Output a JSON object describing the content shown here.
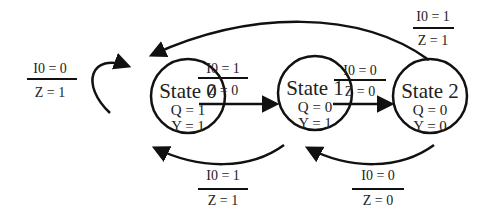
{
  "diagram": {
    "type": "finite-state-machine",
    "colors": {
      "stroke": "#111111",
      "text": "#222222",
      "background": "#ffffff"
    },
    "states": [
      {
        "id": "s0",
        "name": "State 0",
        "q": "Q = 1",
        "y": "Y = 1"
      },
      {
        "id": "s1",
        "name": "State 1",
        "q": "Q = 0",
        "y": "Y = 1"
      },
      {
        "id": "s2",
        "name": "State 2",
        "q": "Q = 0",
        "y": "Y = 0"
      }
    ],
    "transitions": [
      {
        "from": "State 0",
        "to": "State 0",
        "input": "I0 = 0",
        "output": "Z = 1"
      },
      {
        "from": "State 0",
        "to": "State 1",
        "input": "I0 = 1",
        "output": "Z = 0"
      },
      {
        "from": "State 1",
        "to": "State 2",
        "input": "I0 = 0",
        "output": "Z = 0"
      },
      {
        "from": "State 2",
        "to": "State 0",
        "input": "I0 = 1",
        "output": "Z = 1"
      },
      {
        "from": "State 1",
        "to": "State 0",
        "input": "I0 = 1",
        "output": "Z = 1"
      },
      {
        "from": "State 2",
        "to": "State 1",
        "input": "I0 = 0",
        "output": "Z = 0"
      }
    ]
  }
}
